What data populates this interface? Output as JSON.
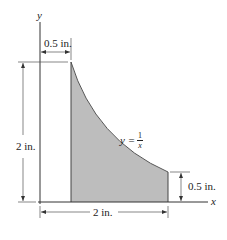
{
  "figure": {
    "axes": {
      "x_label": "x",
      "y_label": "y"
    },
    "curve": {
      "equation_lhs": "y =",
      "equation_num": "1",
      "equation_den": "x"
    },
    "dimensions": {
      "top_width": "0.5 in.",
      "left_height": "2 in.",
      "bottom_width": "2 in.",
      "right_height": "0.5 in."
    },
    "colors": {
      "shade": "#bdbdbd",
      "line": "#333333"
    }
  }
}
